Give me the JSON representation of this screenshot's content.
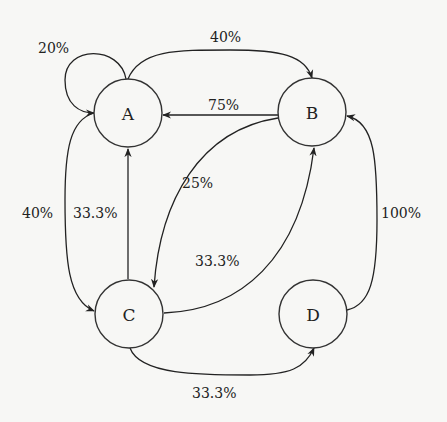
{
  "diagram": {
    "type": "state-transition-graph",
    "nodes": [
      {
        "id": "A",
        "label": "A"
      },
      {
        "id": "B",
        "label": "B"
      },
      {
        "id": "C",
        "label": "C"
      },
      {
        "id": "D",
        "label": "D"
      }
    ],
    "edges": [
      {
        "from": "A",
        "to": "A",
        "label": "20%"
      },
      {
        "from": "A",
        "to": "B",
        "label": "40%"
      },
      {
        "from": "B",
        "to": "A",
        "label": "75%"
      },
      {
        "from": "B",
        "to": "C",
        "label": "25%"
      },
      {
        "from": "A",
        "to": "C",
        "label": "40%"
      },
      {
        "from": "C",
        "to": "A",
        "label": "33.3%"
      },
      {
        "from": "C",
        "to": "B",
        "label": "33.3%"
      },
      {
        "from": "C",
        "to": "D",
        "label": "33.3%"
      },
      {
        "from": "D",
        "to": "B",
        "label": "100%"
      }
    ]
  }
}
